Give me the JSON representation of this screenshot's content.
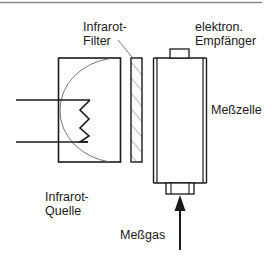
{
  "diagram": {
    "colors": {
      "line": "#1a1a1a",
      "thin_line": "#555555",
      "top_rule": "#8a8a8a",
      "background": "#ffffff"
    },
    "labels": {
      "filter_line1": "Infrarot-",
      "filter_line2": "Filter",
      "receiver_line1": "elektron.",
      "receiver_line2": "Empfänger",
      "cell": "Meßzelle",
      "source_line1": "Infrarot-",
      "source_line2": "Quelle",
      "gas": "Meßgas"
    },
    "components": [
      {
        "id": "infrared-source",
        "label": "Infrarot-Quelle"
      },
      {
        "id": "infrared-filter",
        "label": "Infrarot-Filter"
      },
      {
        "id": "measuring-cell",
        "label": "Meßzelle"
      },
      {
        "id": "electronic-receiver",
        "label": "elektron. Empfänger"
      },
      {
        "id": "gas-inlet",
        "label": "Meßgas"
      }
    ]
  }
}
